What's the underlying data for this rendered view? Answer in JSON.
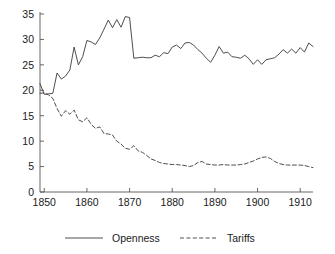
{
  "chart_data": {
    "type": "line",
    "title": "",
    "subtitle": "",
    "xlabel": "",
    "ylabel": "",
    "xlim": [
      1849,
      1913
    ],
    "ylim": [
      0,
      35
    ],
    "grid": false,
    "legend_position": "bottom",
    "y_ticks": [
      0,
      5,
      10,
      15,
      20,
      25,
      30,
      35
    ],
    "y_tick_labels": [
      "0",
      "5",
      "10",
      "15",
      "20",
      "25",
      "30",
      "35"
    ],
    "x_ticks": [
      1850,
      1860,
      1870,
      1880,
      1890,
      1900,
      1910
    ],
    "x_tick_labels": [
      "1850",
      "1860",
      "1870",
      "1880",
      "1890",
      "1900",
      "1910"
    ],
    "x": [
      1849,
      1850,
      1851,
      1852,
      1853,
      1854,
      1855,
      1856,
      1857,
      1858,
      1859,
      1860,
      1861,
      1862,
      1863,
      1864,
      1865,
      1866,
      1867,
      1868,
      1869,
      1870,
      1871,
      1872,
      1873,
      1874,
      1875,
      1876,
      1877,
      1878,
      1879,
      1880,
      1881,
      1882,
      1883,
      1884,
      1885,
      1886,
      1887,
      1888,
      1889,
      1890,
      1891,
      1892,
      1893,
      1894,
      1895,
      1896,
      1897,
      1898,
      1899,
      1900,
      1901,
      1902,
      1903,
      1904,
      1905,
      1906,
      1907,
      1908,
      1909,
      1910,
      1911,
      1912,
      1913
    ],
    "series": [
      {
        "name": "Openness",
        "style": "solid",
        "color": "#3a3a3a",
        "values": [
          21.3,
          19.2,
          19.3,
          19.4,
          23.4,
          22.2,
          22.8,
          24.0,
          28.5,
          25.0,
          26.6,
          29.8,
          29.5,
          29.0,
          30.3,
          32.0,
          33.8,
          32.3,
          33.9,
          32.4,
          34.5,
          34.3,
          26.3,
          26.4,
          26.5,
          26.4,
          26.4,
          26.9,
          26.6,
          27.4,
          27.2,
          28.5,
          28.9,
          28.2,
          29.3,
          29.4,
          28.9,
          28.0,
          27.3,
          26.3,
          25.5,
          26.9,
          28.6,
          27.3,
          27.5,
          26.6,
          26.5,
          26.3,
          26.9,
          26.2,
          25.1,
          26.0,
          25.1,
          26.0,
          26.2,
          26.4,
          27.1,
          28.0,
          27.3,
          28.1,
          27.3,
          28.4,
          27.5,
          29.3,
          28.6
        ]
      },
      {
        "name": "Tariffs",
        "style": "dashed",
        "color": "#3a3a3a",
        "values": [
          19.4,
          19.5,
          19.1,
          18.4,
          16.4,
          14.9,
          16.0,
          15.3,
          16.1,
          14.2,
          13.8,
          14.6,
          13.3,
          12.5,
          12.8,
          11.5,
          11.4,
          11.2,
          10.0,
          9.4,
          8.6,
          8.4,
          9.1,
          8.1,
          7.8,
          7.2,
          6.5,
          6.2,
          5.8,
          5.6,
          5.5,
          5.4,
          5.4,
          5.3,
          5.2,
          5.0,
          5.2,
          5.8,
          6.0,
          5.5,
          5.4,
          5.3,
          5.3,
          5.4,
          5.3,
          5.3,
          5.3,
          5.4,
          5.5,
          5.8,
          6.1,
          6.5,
          6.8,
          6.9,
          6.6,
          6.0,
          5.6,
          5.4,
          5.3,
          5.3,
          5.3,
          5.3,
          5.2,
          5.0,
          4.8
        ]
      }
    ],
    "legend": [
      {
        "label": "Openness",
        "style": "solid"
      },
      {
        "label": "Tariffs",
        "style": "dashed"
      }
    ]
  }
}
